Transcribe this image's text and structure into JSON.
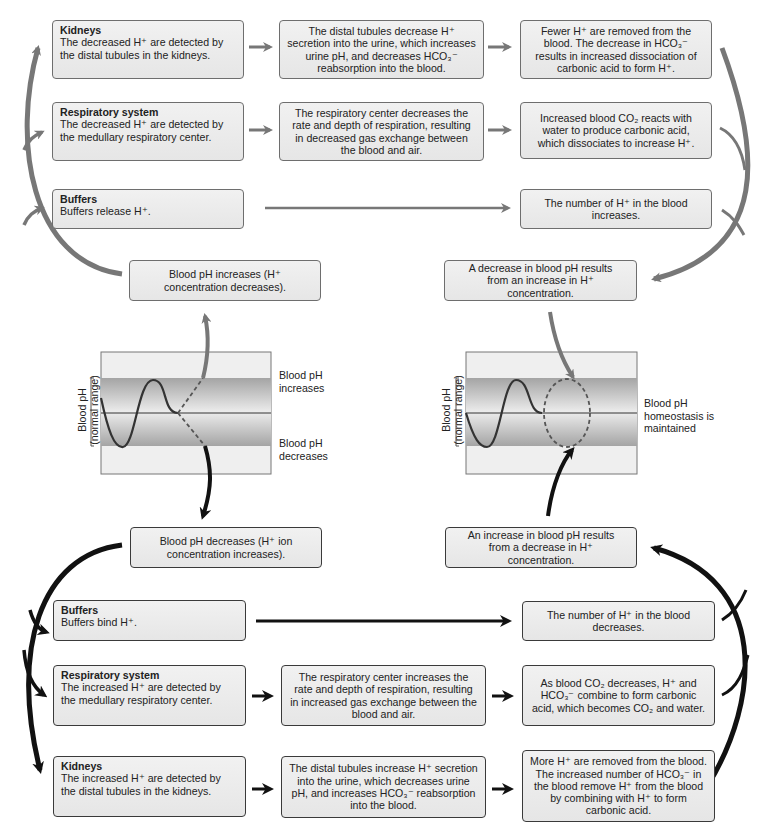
{
  "top": {
    "kidneys": {
      "title": "Kidneys",
      "detect": "The decreased H⁺ are detected by the distal tubules in the kidneys.",
      "action": "The distal tubules decrease H⁺ secretion into the urine, which increases urine pH, and decreases HCO₃⁻ reabsorption into the blood.",
      "result": "Fewer H⁺ are removed from the blood. The decrease in HCO₃⁻ results in increased dissociation of carbonic acid to form H⁺."
    },
    "respiratory": {
      "title": "Respiratory system",
      "detect": "The decreased H⁺ are detected by the medullary respiratory center.",
      "action": "The respiratory center decreases the rate and depth of respiration, resulting in decreased gas exchange between the blood and air.",
      "result": "Increased blood CO₂ reacts with water to produce carbonic acid, which dissociates to increase H⁺."
    },
    "buffers": {
      "title": "Buffers",
      "detect": "Buffers release H⁺.",
      "result": "The number of H⁺ in the blood increases."
    },
    "stimulus": "Blood pH increases (H⁺ concentration decreases).",
    "response": "A decrease in blood pH results from an increase in H⁺ concentration."
  },
  "graphs": {
    "left": {
      "ylabel_line1": "Blood pH",
      "ylabel_line2": "(normal range)",
      "upper_label": "Blood pH increases",
      "lower_label": "Blood pH decreases"
    },
    "right": {
      "ylabel_line1": "Blood pH",
      "ylabel_line2": "(normal range)",
      "side_label": "Blood pH homeostasis is maintained"
    }
  },
  "bottom": {
    "stimulus": "Blood pH decreases (H⁺ ion concentration increases).",
    "response": "An increase in blood pH results from a decrease in H⁺ concentration.",
    "buffers": {
      "title": "Buffers",
      "detect": "Buffers bind H⁺.",
      "result": "The number of H⁺ in the blood decreases."
    },
    "respiratory": {
      "title": "Respiratory system",
      "detect": "The increased H⁺ are detected by the medullary respiratory center.",
      "action": "The respiratory center increases the rate and depth of respiration, resulting in increased gas exchange between the blood and air.",
      "result": "As blood CO₂ decreases, H⁺ and HCO₃⁻ combine to form carbonic acid, which becomes CO₂ and water."
    },
    "kidneys": {
      "title": "Kidneys",
      "detect": "The increased H⁺ are detected by the distal tubules in the kidneys.",
      "action": "The distal tubules increase H⁺ secretion into the urine, which decreases urine pH, and increases HCO₃⁻ reabsorption into the blood.",
      "result": "More H⁺ are removed from the blood. The increased number of HCO₃⁻ in the blood remove H⁺ from the blood by combining with H⁺ to form carbonic acid."
    }
  },
  "colors": {
    "top_arrow": "#777777",
    "bottom_arrow": "#111111",
    "box_fill": "#ebebeb",
    "band_dark": "#a9a9a9",
    "band_light": "#ededed"
  }
}
